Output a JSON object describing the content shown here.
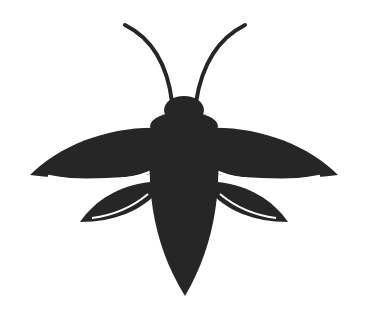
{
  "image": {
    "subject": "firefly silhouette icon",
    "fill_color": "#262626",
    "highlight_color": "#ffffff",
    "background_color": "#ffffff"
  }
}
